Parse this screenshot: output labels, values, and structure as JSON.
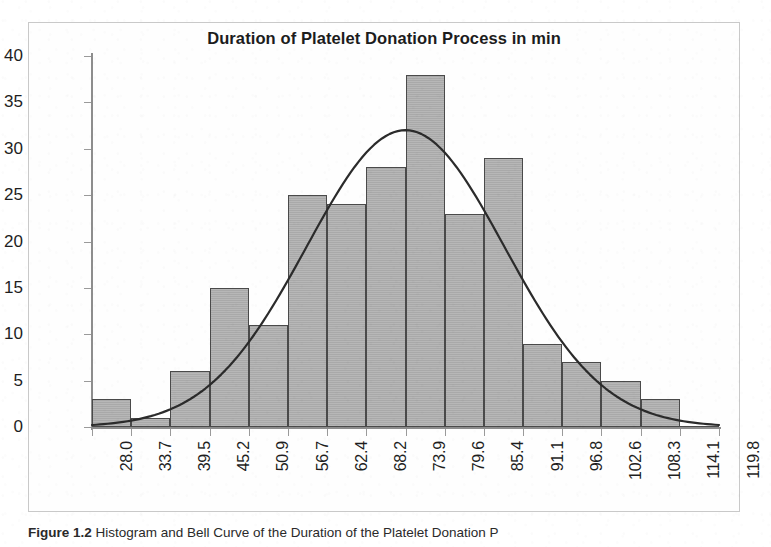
{
  "figure": {
    "caption_label": "Figure 1.2",
    "caption_text": "Histogram and Bell Curve of the Duration of the Platelet Donation P"
  },
  "chart_data": {
    "type": "bar",
    "title": "Duration of Platelet Donation Process in min",
    "xlabel": "",
    "ylabel": "",
    "ylim": [
      0,
      40
    ],
    "ytick_step": 5,
    "ytick_labels": [
      "0",
      "5",
      "10",
      "15",
      "20",
      "25",
      "30",
      "35",
      "40"
    ],
    "xlim": [
      28.0,
      119.8
    ],
    "grid": false,
    "legend": "none",
    "bin_width": 5.7375,
    "bin_edges": [
      28.0,
      33.7,
      39.5,
      45.2,
      50.9,
      56.7,
      62.4,
      68.2,
      73.9,
      79.6,
      85.4,
      91.1,
      96.8,
      102.6,
      108.3,
      114.1,
      119.8
    ],
    "xtick_labels": [
      "28.0",
      "33.7",
      "39.5",
      "45.2",
      "50.9",
      "56.7",
      "62.4",
      "68.2",
      "73.9",
      "79.6",
      "85.4",
      "91.1",
      "96.8",
      "102.6",
      "108.3",
      "114.1",
      "119.8"
    ],
    "values": [
      3,
      1,
      6,
      15,
      11,
      25,
      24,
      28,
      38,
      23,
      29,
      9,
      7,
      5,
      3,
      0
    ],
    "overlay": {
      "type": "line",
      "name": "normal-bell-curve",
      "peak_value": 32,
      "peak_x": 73.9,
      "mean": 73.9,
      "std_dev": 14.5,
      "color": "#2b2b2b"
    },
    "colors": {
      "bar_fill": "#b2b2b2",
      "bar_edge": "#4a4a4a",
      "axis": "#8d8d8d",
      "text": "#1e1e1e",
      "curve": "#2b2b2b"
    }
  }
}
